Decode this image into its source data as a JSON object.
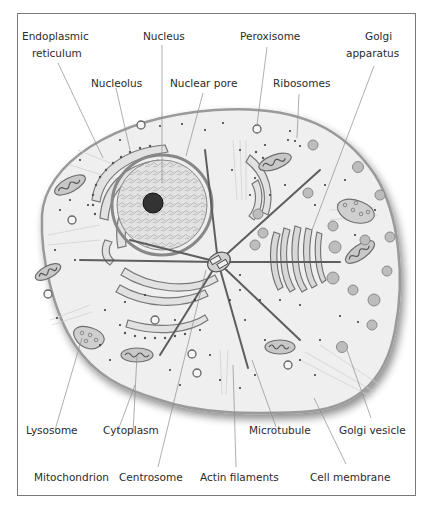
{
  "labels": {
    "endoplasmic_reticulum": [
      "Endoplasmic",
      "reticulum"
    ],
    "nucleus": "Nucleus",
    "peroxisome": "Peroxisome",
    "golgi_apparatus": [
      "Golgi",
      "apparatus"
    ],
    "nucleolus": "Nucleolus",
    "nuclear_pore": "Nuclear pore",
    "ribosomes": "Ribosomes",
    "lysosome": "Lysosome",
    "cytoplasm": "Cytoplasm",
    "microtubule": "Microtubule",
    "golgi_vesicle": "Golgi vesicle",
    "mitochondrion": "Mitochondrion",
    "centrosome": "Centrosome",
    "actin_filaments": "Actin filaments",
    "cell_membrane": "Cell membrane"
  },
  "colors": {
    "cytoplasm": "#efefef",
    "membrane": "#9a9a9a",
    "organelle_fill": "#c8c8c8",
    "organelle_stroke": "#6e6e6e",
    "text": "#2b2b2b"
  }
}
